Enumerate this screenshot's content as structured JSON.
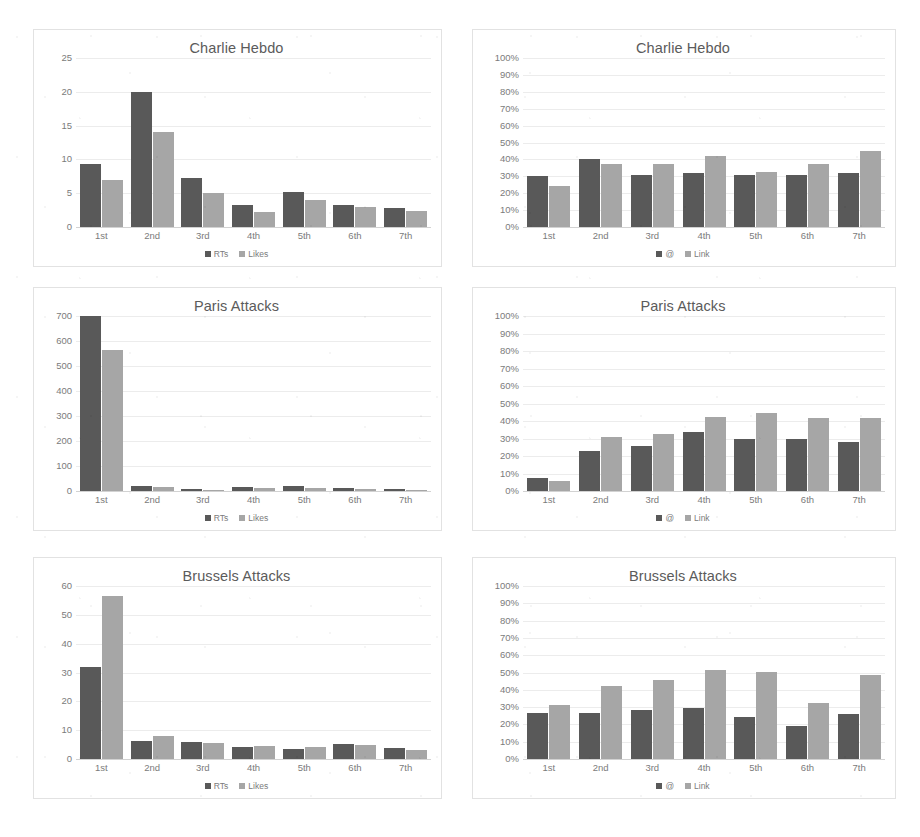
{
  "page": {
    "background": "#ffffff",
    "series_colors": {
      "primary": "#595959",
      "secondary": "#a6a6a6"
    }
  },
  "charts": [
    {
      "id": "charlie-hebdo-engagement",
      "position": "top-left",
      "type": "bar",
      "title": "Charlie Hebdo",
      "xlabel": "",
      "ylabel": "",
      "categories": [
        "1st",
        "2nd",
        "3rd",
        "4th",
        "5th",
        "6th",
        "7th"
      ],
      "yticks": [
        0,
        5,
        10,
        15,
        20,
        25
      ],
      "yticklabels": [
        "0",
        "5",
        "10",
        "15",
        "20",
        "25"
      ],
      "ylim": [
        0,
        25
      ],
      "grid": true,
      "legend_position": "bottom",
      "series": [
        {
          "name": "RTs",
          "color": "#595959",
          "values": [
            9.3,
            19.9,
            7.2,
            3.3,
            5.2,
            3.3,
            2.8
          ]
        },
        {
          "name": "Likes",
          "color": "#a6a6a6",
          "values": [
            7.0,
            14.1,
            5.0,
            2.2,
            4.0,
            3.0,
            2.3
          ]
        }
      ]
    },
    {
      "id": "charlie-hebdo-features",
      "position": "top-right",
      "type": "bar",
      "title": "Charlie Hebdo",
      "xlabel": "",
      "ylabel": "",
      "categories": [
        "1st",
        "2nd",
        "3rd",
        "4th",
        "5th",
        "6th",
        "7th"
      ],
      "yticks": [
        0,
        10,
        20,
        30,
        40,
        50,
        60,
        70,
        80,
        90,
        100
      ],
      "yticklabels": [
        "0%",
        "10%",
        "20%",
        "30%",
        "40%",
        "50%",
        "60%",
        "70%",
        "80%",
        "90%",
        "100%"
      ],
      "ylim": [
        0,
        100
      ],
      "grid": true,
      "legend_position": "bottom",
      "series": [
        {
          "name": "@",
          "color": "#595959",
          "values": [
            30,
            40,
            31,
            32,
            30.5,
            30.5,
            32
          ]
        },
        {
          "name": "Link",
          "color": "#a6a6a6",
          "values": [
            24.5,
            37,
            37,
            42,
            32.5,
            37.5,
            45
          ]
        }
      ]
    },
    {
      "id": "paris-attacks-engagement",
      "position": "middle-left",
      "type": "bar",
      "title": "Paris Attacks",
      "xlabel": "",
      "ylabel": "",
      "categories": [
        "1st",
        "2nd",
        "3rd",
        "4th",
        "5th",
        "6th",
        "7th"
      ],
      "yticks": [
        0,
        100,
        200,
        300,
        400,
        500,
        600,
        700
      ],
      "yticklabels": [
        "0",
        "100",
        "200",
        "300",
        "400",
        "500",
        "600",
        "700"
      ],
      "ylim": [
        0,
        700
      ],
      "grid": true,
      "legend_position": "bottom",
      "series": [
        {
          "name": "RTs",
          "color": "#595959",
          "values": [
            700,
            21,
            9,
            15,
            21,
            14,
            7
          ]
        },
        {
          "name": "Likes",
          "color": "#a6a6a6",
          "values": [
            563,
            15,
            6,
            12,
            13,
            8,
            5
          ]
        }
      ]
    },
    {
      "id": "paris-attacks-features",
      "position": "middle-right",
      "type": "bar",
      "title": "Paris Attacks",
      "xlabel": "",
      "ylabel": "",
      "categories": [
        "1st",
        "2nd",
        "3rd",
        "4th",
        "5th",
        "6th",
        "7th"
      ],
      "yticks": [
        0,
        10,
        20,
        30,
        40,
        50,
        60,
        70,
        80,
        90,
        100
      ],
      "yticklabels": [
        "0%",
        "10%",
        "20%",
        "30%",
        "40%",
        "50%",
        "60%",
        "70%",
        "80%",
        "90%",
        "100%"
      ],
      "ylim": [
        0,
        100
      ],
      "grid": true,
      "legend_position": "bottom",
      "series": [
        {
          "name": "@",
          "color": "#595959",
          "values": [
            7.5,
            23,
            26,
            33.5,
            30,
            30,
            28
          ]
        },
        {
          "name": "Link",
          "color": "#a6a6a6",
          "values": [
            5.5,
            31,
            32.5,
            42.5,
            44.5,
            42,
            41.5
          ]
        }
      ]
    },
    {
      "id": "brussels-attacks-engagement",
      "position": "bottom-left",
      "type": "bar",
      "title": "Brussels Attacks",
      "xlabel": "",
      "ylabel": "",
      "categories": [
        "1st",
        "2nd",
        "3rd",
        "4th",
        "5th",
        "6th",
        "7th"
      ],
      "yticks": [
        0,
        10,
        20,
        30,
        40,
        50,
        60
      ],
      "yticklabels": [
        "0",
        "10",
        "20",
        "30",
        "40",
        "50",
        "60"
      ],
      "ylim": [
        0,
        60
      ],
      "grid": true,
      "legend_position": "bottom",
      "series": [
        {
          "name": "RTs",
          "color": "#595959",
          "values": [
            32,
            6.3,
            5.8,
            4.0,
            3.5,
            5.2,
            3.8
          ]
        },
        {
          "name": "Likes",
          "color": "#a6a6a6",
          "values": [
            56.5,
            8.0,
            5.7,
            4.5,
            4.3,
            5.0,
            3.0
          ]
        }
      ]
    },
    {
      "id": "brussels-attacks-features",
      "position": "bottom-right",
      "type": "bar",
      "title": "Brussels Attacks",
      "xlabel": "",
      "ylabel": "",
      "categories": [
        "1st",
        "2nd",
        "3rd",
        "4th",
        "5th",
        "6th",
        "7th"
      ],
      "yticks": [
        0,
        10,
        20,
        30,
        40,
        50,
        60,
        70,
        80,
        90,
        100
      ],
      "yticklabels": [
        "0%",
        "10%",
        "20%",
        "30%",
        "40%",
        "50%",
        "60%",
        "70%",
        "80%",
        "90%",
        "100%"
      ],
      "ylim": [
        0,
        100
      ],
      "grid": true,
      "legend_position": "bottom",
      "series": [
        {
          "name": "@",
          "color": "#595959",
          "values": [
            26.5,
            26.5,
            28.5,
            29.5,
            24.5,
            19,
            26
          ]
        },
        {
          "name": "Link",
          "color": "#a6a6a6",
          "values": [
            31,
            42,
            45.5,
            51.5,
            50.5,
            32.5,
            48.5
          ]
        }
      ]
    }
  ],
  "chart_data": [
    {
      "type": "bar",
      "title": "Charlie Hebdo",
      "xlabel": "",
      "ylabel": "",
      "ylim": [
        0,
        25
      ],
      "grid": true,
      "legend_position": "bottom",
      "categories": [
        "1st",
        "2nd",
        "3rd",
        "4th",
        "5th",
        "6th",
        "7th"
      ],
      "series": [
        {
          "name": "RTs",
          "values": [
            9.3,
            19.9,
            7.2,
            3.3,
            5.2,
            3.3,
            2.8
          ]
        },
        {
          "name": "Likes",
          "values": [
            7.0,
            14.1,
            5.0,
            2.2,
            4.0,
            3.0,
            2.3
          ]
        }
      ]
    },
    {
      "type": "bar",
      "title": "Charlie Hebdo",
      "xlabel": "",
      "ylabel": "",
      "ylim": [
        0,
        100
      ],
      "grid": true,
      "legend_position": "bottom",
      "categories": [
        "1st",
        "2nd",
        "3rd",
        "4th",
        "5th",
        "6th",
        "7th"
      ],
      "series": [
        {
          "name": "@",
          "values": [
            30,
            40,
            31,
            32,
            30.5,
            30.5,
            32
          ]
        },
        {
          "name": "Link",
          "values": [
            24.5,
            37,
            37,
            42,
            32.5,
            37.5,
            45
          ]
        }
      ]
    },
    {
      "type": "bar",
      "title": "Paris Attacks",
      "xlabel": "",
      "ylabel": "",
      "ylim": [
        0,
        700
      ],
      "grid": true,
      "legend_position": "bottom",
      "categories": [
        "1st",
        "2nd",
        "3rd",
        "4th",
        "5th",
        "6th",
        "7th"
      ],
      "series": [
        {
          "name": "RTs",
          "values": [
            700,
            21,
            9,
            15,
            21,
            14,
            7
          ]
        },
        {
          "name": "Likes",
          "values": [
            563,
            15,
            6,
            12,
            13,
            8,
            5
          ]
        }
      ]
    },
    {
      "type": "bar",
      "title": "Paris Attacks",
      "xlabel": "",
      "ylabel": "",
      "ylim": [
        0,
        100
      ],
      "grid": true,
      "legend_position": "bottom",
      "categories": [
        "1st",
        "2nd",
        "3rd",
        "4th",
        "5th",
        "6th",
        "7th"
      ],
      "series": [
        {
          "name": "@",
          "values": [
            7.5,
            23,
            26,
            33.5,
            30,
            30,
            28
          ]
        },
        {
          "name": "Link",
          "values": [
            5.5,
            31,
            32.5,
            42.5,
            44.5,
            42,
            41.5
          ]
        }
      ]
    },
    {
      "type": "bar",
      "title": "Brussels Attacks",
      "xlabel": "",
      "ylabel": "",
      "ylim": [
        0,
        60
      ],
      "grid": true,
      "legend_position": "bottom",
      "categories": [
        "1st",
        "2nd",
        "3rd",
        "4th",
        "5th",
        "6th",
        "7th"
      ],
      "series": [
        {
          "name": "RTs",
          "values": [
            32,
            6.3,
            5.8,
            4.0,
            3.5,
            5.2,
            3.8
          ]
        },
        {
          "name": "Likes",
          "values": [
            56.5,
            8.0,
            5.7,
            4.5,
            4.3,
            5.0,
            3.0
          ]
        }
      ]
    },
    {
      "type": "bar",
      "title": "Brussels Attacks",
      "xlabel": "",
      "ylabel": "",
      "ylim": [
        0,
        100
      ],
      "grid": true,
      "legend_position": "bottom",
      "categories": [
        "1st",
        "2nd",
        "3rd",
        "4th",
        "5th",
        "6th",
        "7th"
      ],
      "series": [
        {
          "name": "@",
          "values": [
            26.5,
            26.5,
            28.5,
            29.5,
            24.5,
            19,
            26
          ]
        },
        {
          "name": "Link",
          "values": [
            31,
            42,
            45.5,
            51.5,
            50.5,
            32.5,
            48.5
          ]
        }
      ]
    }
  ]
}
